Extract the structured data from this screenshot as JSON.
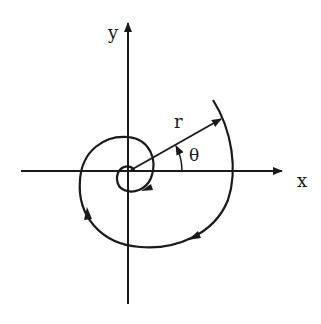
{
  "diagram": {
    "type": "polar-spiral",
    "labels": {
      "x_axis": "x",
      "y_axis": "y",
      "radius": "r",
      "angle": "θ"
    },
    "colors": {
      "ink": "#1a1a1a",
      "background": "#ffffff"
    },
    "origin": [
      128,
      171
    ],
    "spiral_direction": "clockwise-inward arrows along curve"
  }
}
